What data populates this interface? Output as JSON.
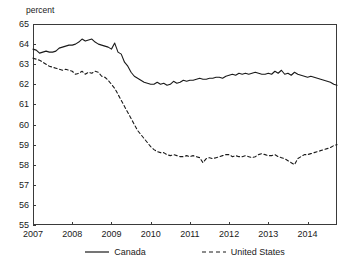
{
  "title": "",
  "ylabel": "percent",
  "legend": {
    "canada": "Canada",
    "united_states": "United States"
  },
  "chart_data": {
    "type": "line",
    "title": "",
    "subtitle": "",
    "xlabel": "",
    "ylabel": "percent",
    "ylim": [
      55,
      65
    ],
    "xlim": [
      2007.0,
      2014.75
    ],
    "ytick_labels": [
      "65",
      "64",
      "63",
      "62",
      "61",
      "60",
      "59",
      "58",
      "57",
      "56",
      "55"
    ],
    "yticks": [
      65,
      64,
      63,
      62,
      61,
      60,
      59,
      58,
      57,
      56,
      55
    ],
    "xtick_labels": [
      "2007",
      "2008",
      "2009",
      "2010",
      "2011",
      "2012",
      "2013",
      "2014"
    ],
    "xticks": [
      2007,
      2008,
      2009,
      2010,
      2011,
      2012,
      2013,
      2014
    ],
    "grid": false,
    "legend_position": "below",
    "series": [
      {
        "name": "Canada",
        "style": "solid",
        "color": "#1a1a1a",
        "x": [
          2007.0,
          2007.083,
          2007.167,
          2007.25,
          2007.333,
          2007.417,
          2007.5,
          2007.583,
          2007.667,
          2007.75,
          2007.833,
          2007.917,
          2008.0,
          2008.083,
          2008.167,
          2008.25,
          2008.333,
          2008.417,
          2008.5,
          2008.583,
          2008.667,
          2008.75,
          2008.833,
          2008.917,
          2009.0,
          2009.083,
          2009.167,
          2009.25,
          2009.333,
          2009.417,
          2009.5,
          2009.583,
          2009.667,
          2009.75,
          2009.833,
          2009.917,
          2010.0,
          2010.083,
          2010.167,
          2010.25,
          2010.333,
          2010.417,
          2010.5,
          2010.583,
          2010.667,
          2010.75,
          2010.833,
          2010.917,
          2011.0,
          2011.083,
          2011.167,
          2011.25,
          2011.333,
          2011.417,
          2011.5,
          2011.583,
          2011.667,
          2011.75,
          2011.833,
          2011.917,
          2012.0,
          2012.083,
          2012.167,
          2012.25,
          2012.333,
          2012.417,
          2012.5,
          2012.583,
          2012.667,
          2012.75,
          2012.833,
          2012.917,
          2013.0,
          2013.083,
          2013.167,
          2013.25,
          2013.333,
          2013.417,
          2013.5,
          2013.583,
          2013.667,
          2013.75,
          2013.833,
          2013.917,
          2014.0,
          2014.083,
          2014.167,
          2014.25,
          2014.333,
          2014.417,
          2014.5,
          2014.583,
          2014.667,
          2014.75
        ],
        "y": [
          63.75,
          63.7,
          63.55,
          63.6,
          63.65,
          63.6,
          63.6,
          63.65,
          63.8,
          63.85,
          63.9,
          63.95,
          63.95,
          64.0,
          64.1,
          64.25,
          64.15,
          64.2,
          64.25,
          64.1,
          64.0,
          63.95,
          63.9,
          63.85,
          63.75,
          64.05,
          63.6,
          63.5,
          63.1,
          62.9,
          62.6,
          62.4,
          62.3,
          62.2,
          62.1,
          62.05,
          62.0,
          62.0,
          62.1,
          62.0,
          62.05,
          61.95,
          62.0,
          62.15,
          62.05,
          62.1,
          62.2,
          62.15,
          62.2,
          62.2,
          62.25,
          62.3,
          62.25,
          62.25,
          62.3,
          62.3,
          62.35,
          62.35,
          62.3,
          62.4,
          62.45,
          62.5,
          62.45,
          62.55,
          62.5,
          62.55,
          62.5,
          62.55,
          62.6,
          62.55,
          62.5,
          62.5,
          62.55,
          62.5,
          62.65,
          62.55,
          62.7,
          62.5,
          62.55,
          62.45,
          62.6,
          62.5,
          62.45,
          62.4,
          62.35,
          62.4,
          62.35,
          62.3,
          62.25,
          62.2,
          62.15,
          62.1,
          62.0,
          61.95
        ]
      },
      {
        "name": "United States",
        "style": "dashed",
        "color": "#1a1a1a",
        "x": [
          2007.0,
          2007.083,
          2007.167,
          2007.25,
          2007.333,
          2007.417,
          2007.5,
          2007.583,
          2007.667,
          2007.75,
          2007.833,
          2007.917,
          2008.0,
          2008.083,
          2008.167,
          2008.25,
          2008.333,
          2008.417,
          2008.5,
          2008.583,
          2008.667,
          2008.75,
          2008.833,
          2008.917,
          2009.0,
          2009.083,
          2009.167,
          2009.25,
          2009.333,
          2009.417,
          2009.5,
          2009.583,
          2009.667,
          2009.75,
          2009.833,
          2009.917,
          2010.0,
          2010.083,
          2010.167,
          2010.25,
          2010.333,
          2010.417,
          2010.5,
          2010.583,
          2010.667,
          2010.75,
          2010.833,
          2010.917,
          2011.0,
          2011.083,
          2011.167,
          2011.25,
          2011.333,
          2011.417,
          2011.5,
          2011.583,
          2011.667,
          2011.75,
          2011.833,
          2011.917,
          2012.0,
          2012.083,
          2012.167,
          2012.25,
          2012.333,
          2012.417,
          2012.5,
          2012.583,
          2012.667,
          2012.75,
          2012.833,
          2012.917,
          2013.0,
          2013.083,
          2013.167,
          2013.25,
          2013.333,
          2013.417,
          2013.5,
          2013.583,
          2013.667,
          2013.75,
          2013.833,
          2013.917,
          2014.0,
          2014.083,
          2014.167,
          2014.25,
          2014.333,
          2014.417,
          2014.5,
          2014.583,
          2014.667,
          2014.75
        ],
        "y": [
          63.3,
          63.25,
          63.2,
          63.1,
          63.0,
          62.9,
          62.85,
          62.8,
          62.75,
          62.7,
          62.75,
          62.7,
          62.65,
          62.5,
          62.55,
          62.65,
          62.5,
          62.6,
          62.55,
          62.65,
          62.6,
          62.4,
          62.35,
          62.2,
          62.0,
          61.8,
          61.5,
          61.2,
          60.9,
          60.6,
          60.3,
          60.0,
          59.7,
          59.5,
          59.3,
          59.1,
          58.9,
          58.75,
          58.65,
          58.6,
          58.6,
          58.5,
          58.45,
          58.5,
          58.45,
          58.4,
          58.4,
          58.45,
          58.4,
          58.45,
          58.4,
          58.35,
          58.1,
          58.3,
          58.35,
          58.3,
          58.35,
          58.4,
          58.45,
          58.5,
          58.5,
          58.4,
          58.45,
          58.4,
          58.4,
          58.45,
          58.4,
          58.35,
          58.4,
          58.5,
          58.55,
          58.5,
          58.45,
          58.45,
          58.5,
          58.4,
          58.35,
          58.3,
          58.2,
          58.1,
          58.0,
          58.3,
          58.4,
          58.5,
          58.5,
          58.55,
          58.6,
          58.65,
          58.7,
          58.75,
          58.8,
          58.85,
          58.95,
          59.0
        ]
      }
    ]
  }
}
